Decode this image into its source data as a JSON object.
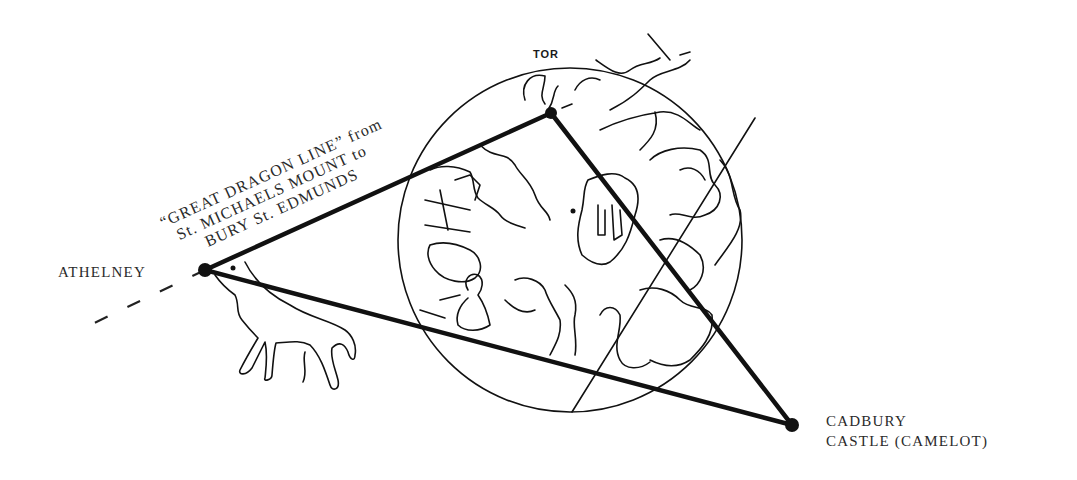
{
  "diagram": {
    "colors": {
      "ink": "#111111",
      "background": "#ffffff"
    },
    "circle": {
      "cx": 570,
      "cy": 240,
      "r": 172
    },
    "points": {
      "athelney": {
        "label": "ATHELNEY",
        "x": 205,
        "y": 270
      },
      "tor": {
        "label": "TOR",
        "x": 551,
        "y": 113
      },
      "cadbury": {
        "label_line1": "CADBURY",
        "label_line2": "CASTLE (CAMELOT)",
        "x": 792,
        "y": 425
      }
    },
    "dragon_line": {
      "line1": "“GREAT DRAGON LINE” from",
      "line2": "St. MICHAELS MOUNT to",
      "line3": "BURY St. EDMUNDS"
    },
    "edges": [
      {
        "from": "athelney",
        "to": "tor"
      },
      {
        "from": "tor",
        "to": "cadbury"
      },
      {
        "from": "athelney",
        "to": "cadbury"
      }
    ]
  }
}
